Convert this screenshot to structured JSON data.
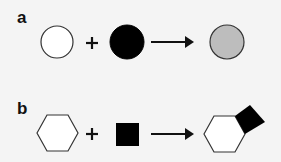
{
  "panels": [
    {
      "label": "a",
      "reactants": [
        "white circle",
        "black circle"
      ],
      "operator": "+",
      "product": "gray circle"
    },
    {
      "label": "b",
      "reactants": [
        "hexagon",
        "black square"
      ],
      "operator": "+",
      "product": "hexagon with attached black square"
    }
  ],
  "colors": {
    "background": "#f4f4f4",
    "stroke": "#333333",
    "white_fill": "#ffffff",
    "black_fill": "#000000",
    "gray_fill": "#bdbdbd"
  }
}
